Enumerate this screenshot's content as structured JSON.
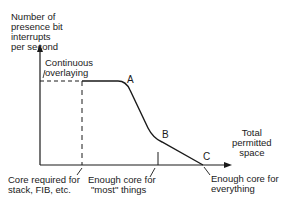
{
  "diagram": {
    "y_axis_label": [
      "Number of",
      "presence bit",
      "interrupts",
      "per second"
    ],
    "x_axis_label": [
      "Total",
      "permitted",
      "space"
    ],
    "annotations": {
      "continuous": [
        "Continuous",
        "overlaying"
      ],
      "core_required": [
        "Core required for",
        "stack, FIB, etc."
      ],
      "enough_most": [
        "Enough core for",
        "\"most\" things"
      ],
      "enough_everything": [
        "Enough core for",
        "everything"
      ]
    },
    "points": {
      "a": "A",
      "b": "B",
      "c": "C"
    }
  }
}
